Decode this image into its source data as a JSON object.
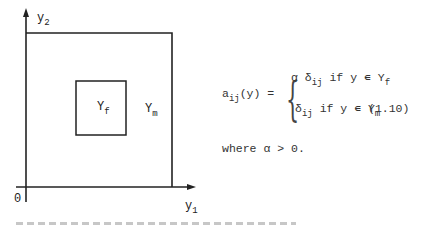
{
  "figure": {
    "axis_y_label": "y",
    "axis_y_sub": "2",
    "axis_x_label": "y",
    "axis_x_sub": "1",
    "origin_label": "0",
    "inner_region_label": "Y",
    "inner_region_sub": "f",
    "outer_region_label": "Y",
    "outer_region_sub": "m"
  },
  "equation": {
    "lhs": "a",
    "lhs_sub": "ij",
    "lhs_arg": "(y) =",
    "case1_coef": "α δ",
    "case1_sub": "ij",
    "case1_cond": "if y ∊ Y",
    "case1_cond_sub": "f",
    "case2_coef": "δ",
    "case2_sub": "ij",
    "case2_cond": "if y ∊ Y",
    "case2_cond_sub": "m",
    "number": "(1.10)"
  },
  "where_text": "where α > 0."
}
